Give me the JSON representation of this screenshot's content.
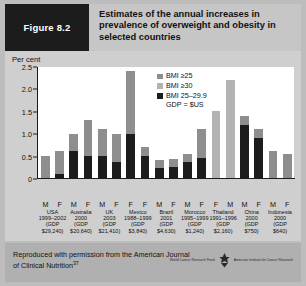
{
  "header": {
    "figure_label": "Figure 8.2",
    "title": "Estimates of the annual increases in prevalence of overweight and obesity in selected countries"
  },
  "footer": {
    "credit": "Reproduced with permission from the American Journal of Clinical Nutrition",
    "credit_ref": "37",
    "logo_left": "World Cancer Research Fund",
    "logo_right": "American Institute for Cancer Research"
  },
  "colors": {
    "bmi25": "#8e8e8e",
    "bmi30": "#b3b3b3",
    "bmi25_29": "#1c1c1c",
    "plot_bg": "#ffffff",
    "panel_bg": "#cfcfcf",
    "header_tab": "#1c1c1c"
  },
  "chart_data": {
    "type": "bar",
    "title": "Estimates of the annual increases in prevalence of overweight and obesity in selected countries",
    "ylabel": "Per cent",
    "xlabel": "",
    "ylim": [
      0,
      2.5
    ],
    "yticks": [
      "0",
      "0.5",
      "1.0",
      "1.5",
      "2.0",
      "2.5"
    ],
    "grid": false,
    "legend_position": "inside-top-right",
    "legend": [
      {
        "label": "BMI ≥25",
        "color": "#8e8e8e"
      },
      {
        "label": "BMI ≥30",
        "color": "#b3b3b3"
      },
      {
        "label": "BMI 25–29.9",
        "color": "#1c1c1c"
      }
    ],
    "legend_note": "GDP = $US",
    "sex_labels": [
      "M",
      "F",
      "M",
      "F",
      "M",
      "F",
      "F",
      "F",
      "M",
      "F",
      "M",
      "F",
      "F",
      "M",
      "M",
      "F",
      "M",
      "F"
    ],
    "countries": [
      {
        "name": "USA",
        "years": "1999–2002",
        "gdp": "(GDP $29,240)"
      },
      {
        "name": "Australia",
        "years": "2000",
        "gdp": "(GDP $20,640)"
      },
      {
        "name": "UK",
        "years": "2003",
        "gdp": "(GDP $21,410)"
      },
      {
        "name": "Mexico",
        "years": "1988–1999",
        "gdp": "(GDP $3,840)"
      },
      {
        "name": "Brazil",
        "years": "2001",
        "gdp": "(GDP $4,630)"
      },
      {
        "name": "Morocco",
        "years": "1995–1999",
        "gdp": "(GDP $1,240)"
      },
      {
        "name": "Thailand",
        "years": "1991–1996",
        "gdp": "(GDP $2,160)"
      },
      {
        "name": "China",
        "years": "2000",
        "gdp": "(GDP $750)"
      },
      {
        "name": "Indonesia",
        "years": "2000",
        "gdp": "(GDP $640)"
      }
    ],
    "bars": [
      {
        "country": "USA",
        "sex": "M",
        "total": 0.5,
        "bmi25_29": 0.0,
        "upper_series": "BMI ≥25"
      },
      {
        "country": "USA",
        "sex": "F",
        "total": 0.6,
        "bmi25_29": 0.1,
        "upper_series": "BMI ≥25"
      },
      {
        "country": "Australia",
        "sex": "M",
        "total": 1.0,
        "bmi25_29": 0.6,
        "upper_series": "BMI ≥25"
      },
      {
        "country": "Australia",
        "sex": "F",
        "total": 1.3,
        "bmi25_29": 0.5,
        "upper_series": "BMI ≥25"
      },
      {
        "country": "UK",
        "sex": "M",
        "total": 1.1,
        "bmi25_29": 0.5,
        "upper_series": "BMI ≥25"
      },
      {
        "country": "UK",
        "sex": "F",
        "total": 1.0,
        "bmi25_29": 0.37,
        "upper_series": "BMI ≥25"
      },
      {
        "country": "Mexico",
        "sex": "F",
        "total": 2.4,
        "bmi25_29": 1.0,
        "upper_series": "BMI ≥25"
      },
      {
        "country": "Mexico",
        "sex": "F",
        "total": 0.7,
        "bmi25_29": 0.5,
        "upper_series": "BMI ≥25"
      },
      {
        "country": "Brazil",
        "sex": "M",
        "total": 0.4,
        "bmi25_29": 0.22,
        "upper_series": "BMI ≥25"
      },
      {
        "country": "Brazil",
        "sex": "F",
        "total": 0.42,
        "bmi25_29": 0.25,
        "upper_series": "BMI ≥25"
      },
      {
        "country": "Morocco",
        "sex": "M",
        "total": 0.55,
        "bmi25_29": 0.35,
        "upper_series": "BMI ≥25"
      },
      {
        "country": "Morocco",
        "sex": "F",
        "total": 1.1,
        "bmi25_29": 0.45,
        "upper_series": "BMI ≥25"
      },
      {
        "country": "Thailand",
        "sex": "F",
        "total": 1.5,
        "bmi25_29": 0.0,
        "upper_series": "BMI ≥30"
      },
      {
        "country": "Thailand",
        "sex": "M",
        "total": 2.2,
        "bmi25_29": 0.0,
        "upper_series": "BMI ≥30"
      },
      {
        "country": "China",
        "sex": "M",
        "total": 1.4,
        "bmi25_29": 1.2,
        "upper_series": "BMI ≥25"
      },
      {
        "country": "China",
        "sex": "F",
        "total": 1.1,
        "bmi25_29": 0.9,
        "upper_series": "BMI ≥25"
      },
      {
        "country": "Indonesia",
        "sex": "M",
        "total": 0.6,
        "bmi25_29": 0.0,
        "upper_series": "BMI ≥25"
      },
      {
        "country": "Indonesia",
        "sex": "F",
        "total": 0.55,
        "bmi25_29": 0.0,
        "upper_series": "BMI ≥25"
      }
    ]
  }
}
